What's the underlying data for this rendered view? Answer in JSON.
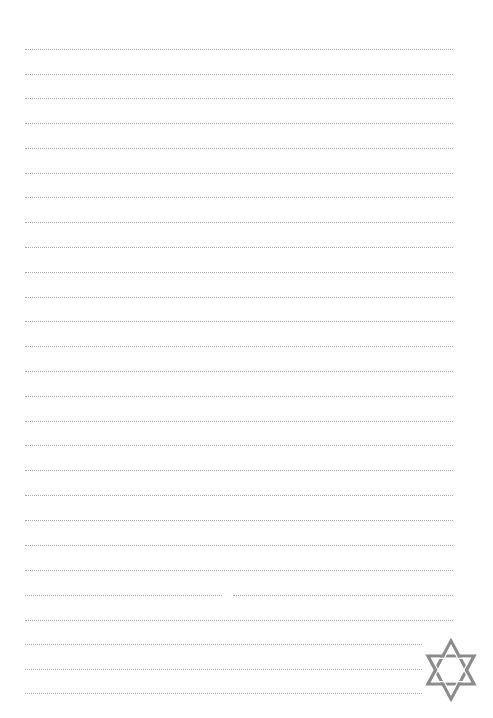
{
  "page": {
    "type": "lined-writing-paper",
    "background_color": "#ffffff",
    "line_color": "#a9a9a9",
    "line_style": "dotted",
    "line_count": 27
  },
  "lines": [
    {
      "y": 49,
      "x1": 25,
      "x2": 453
    },
    {
      "y": 74,
      "x1": 25,
      "x2": 453
    },
    {
      "y": 98,
      "x1": 25,
      "x2": 453
    },
    {
      "y": 123,
      "x1": 25,
      "x2": 453
    },
    {
      "y": 148,
      "x1": 25,
      "x2": 453
    },
    {
      "y": 173,
      "x1": 25,
      "x2": 453
    },
    {
      "y": 197,
      "x1": 25,
      "x2": 453
    },
    {
      "y": 222,
      "x1": 25,
      "x2": 453
    },
    {
      "y": 247,
      "x1": 25,
      "x2": 453
    },
    {
      "y": 272,
      "x1": 25,
      "x2": 453
    },
    {
      "y": 297,
      "x1": 25,
      "x2": 453
    },
    {
      "y": 321,
      "x1": 25,
      "x2": 453
    },
    {
      "y": 346,
      "x1": 25,
      "x2": 453
    },
    {
      "y": 371,
      "x1": 25,
      "x2": 453
    },
    {
      "y": 396,
      "x1": 25,
      "x2": 453
    },
    {
      "y": 421,
      "x1": 25,
      "x2": 453
    },
    {
      "y": 445,
      "x1": 25,
      "x2": 453
    },
    {
      "y": 470,
      "x1": 25,
      "x2": 453
    },
    {
      "y": 495,
      "x1": 25,
      "x2": 453
    },
    {
      "y": 520,
      "x1": 25,
      "x2": 453
    },
    {
      "y": 545,
      "x1": 25,
      "x2": 453
    },
    {
      "y": 570,
      "x1": 25,
      "x2": 453
    },
    {
      "y": 595,
      "x1": 25,
      "x2": 453,
      "gap": [
        222,
        233
      ]
    },
    {
      "y": 620,
      "x1": 25,
      "x2": 453
    },
    {
      "y": 644,
      "x1": 25,
      "x2": 422
    },
    {
      "y": 669,
      "x1": 25,
      "x2": 422
    },
    {
      "y": 693,
      "x1": 25,
      "x2": 422
    }
  ],
  "emblem": {
    "icon": "star-of-david-icon",
    "color": "#8c8c8c",
    "position": "bottom-right"
  }
}
